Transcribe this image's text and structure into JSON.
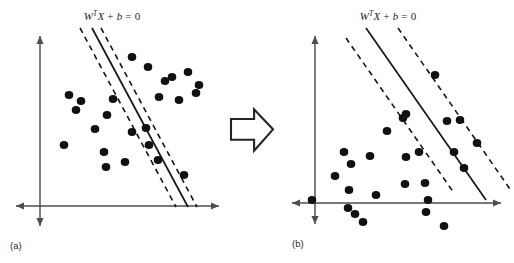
{
  "figure": {
    "width": 514,
    "height": 263,
    "background_color": "#ffffff",
    "ink_color": "#111111",
    "axis_color": "#4d4d4d"
  },
  "transition_arrow": {
    "icon": "right-block-arrow-icon",
    "direction": "right",
    "style": "hollow-outline",
    "fill_color": "#ffffff",
    "stroke_color": "#232323",
    "x": 231,
    "y": 108,
    "width": 42,
    "height": 44
  },
  "panels": [
    {
      "id": "panel-a",
      "caption": "(a)",
      "caption_x": 10,
      "caption_y": 249,
      "equation": {
        "prefix": "W",
        "superscript": "T",
        "variable": "X",
        "plus": "+",
        "intercept": "b",
        "equals": "=",
        "value": "0",
        "full_text": "W^T X + b = 0",
        "x": 112,
        "y": 20
      },
      "axes": {
        "vertical": {
          "x": 40,
          "y_top": 36,
          "y_bottom": 226,
          "double_headed": true
        },
        "horizontal": {
          "y": 206,
          "x_left": 16,
          "x_right": 219,
          "double_headed": true
        }
      },
      "hyperplane": {
        "x1": 92,
        "y1": 28,
        "x2": 188,
        "y2": 207,
        "slope_desc": "steep"
      },
      "margins": [
        {
          "name": "margin-upper-left",
          "x1": 80,
          "y1": 28,
          "x2": 176,
          "y2": 207
        },
        {
          "name": "margin-lower-right",
          "x1": 101,
          "y1": 28,
          "x2": 197,
          "y2": 207
        }
      ],
      "margin_width_desc": "narrow",
      "points": [
        [
          132,
          57
        ],
        [
          148,
          67
        ],
        [
          188,
          72
        ],
        [
          69,
          95
        ],
        [
          81,
          101
        ],
        [
          165,
          81
        ],
        [
          199,
          85
        ],
        [
          107,
          115
        ],
        [
          76,
          110
        ],
        [
          113,
          99
        ],
        [
          159,
          97
        ],
        [
          179,
          100
        ],
        [
          196,
          93
        ],
        [
          146,
          128
        ],
        [
          95,
          129
        ],
        [
          64,
          145
        ],
        [
          132,
          132
        ],
        [
          149,
          145
        ],
        [
          104,
          152
        ],
        [
          125,
          162
        ],
        [
          158,
          160
        ],
        [
          106,
          167
        ],
        [
          184,
          175
        ],
        [
          172,
          77
        ]
      ]
    },
    {
      "id": "panel-b",
      "caption": "(b)",
      "caption_x": 292,
      "caption_y": 247,
      "equation": {
        "prefix": "W",
        "superscript": "T",
        "variable": "X",
        "plus": "+",
        "intercept": "b",
        "equals": "=",
        "value": "0",
        "full_text": "W^T X + b = 0",
        "x": 388,
        "y": 20
      },
      "axes": {
        "vertical": {
          "x": 315,
          "y_top": 36,
          "y_bottom": 224,
          "double_headed": true
        },
        "horizontal": {
          "y": 203,
          "x_left": 292,
          "x_right": 501,
          "double_headed": true
        }
      },
      "hyperplane": {
        "x1": 366,
        "y1": 28,
        "x2": 486,
        "y2": 200,
        "slope_desc": "moderate"
      },
      "margins": [
        {
          "name": "margin-upper-left",
          "x1": 346,
          "y1": 38,
          "x2": 454,
          "y2": 193
        },
        {
          "name": "margin-lower-right",
          "x1": 398,
          "y1": 28,
          "x2": 512,
          "y2": 192
        }
      ],
      "margin_width_desc": "wide",
      "points": [
        [
          435,
          75
        ],
        [
          406,
          114
        ],
        [
          403,
          118
        ],
        [
          447,
          121
        ],
        [
          387,
          131
        ],
        [
          460,
          120
        ],
        [
          344,
          152
        ],
        [
          370,
          156
        ],
        [
          419,
          152
        ],
        [
          454,
          152
        ],
        [
          477,
          143
        ],
        [
          351,
          164
        ],
        [
          464,
          168
        ],
        [
          406,
          157
        ],
        [
          335,
          176
        ],
        [
          405,
          184
        ],
        [
          425,
          183
        ],
        [
          349,
          190
        ],
        [
          376,
          195
        ],
        [
          428,
          200
        ],
        [
          312,
          200
        ],
        [
          348,
          208
        ],
        [
          426,
          212
        ],
        [
          355,
          214
        ],
        [
          363,
          222
        ],
        [
          444,
          226
        ]
      ]
    }
  ]
}
